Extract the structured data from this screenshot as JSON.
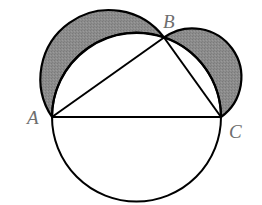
{
  "diagram": {
    "type": "geometry",
    "points": {
      "A": {
        "label": "A",
        "x": 52,
        "y": 117
      },
      "B": {
        "label": "B",
        "x": 164,
        "y": 37.5
      },
      "C": {
        "label": "C",
        "x": 221,
        "y": 117
      }
    },
    "main_circle": {
      "cx": 136.5,
      "cy": 117,
      "r": 84.5
    },
    "semicircle_AB": {
      "r": 68.7
    },
    "semicircle_BC": {
      "r": 48.9
    },
    "colors": {
      "stroke": "#000000",
      "shade": "#8a8a8a",
      "label": "#6e6e6e"
    }
  }
}
